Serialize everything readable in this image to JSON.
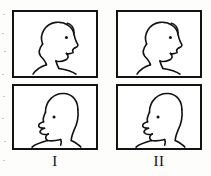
{
  "figure": {
    "ink_color": "#131313",
    "paper_color": "#ffffff",
    "columns": [
      {
        "label": "I",
        "label_name": "roman-numeral-one",
        "panels": [
          {
            "row": "top",
            "caption": "",
            "pose": "relaxed head profile facing right, closed mouth",
            "eye": "dot"
          },
          {
            "row": "bottom",
            "caption": "",
            "pose": "elongated head profile facing right, jaw thrust forward, open mouth",
            "eye": "dot"
          }
        ]
      },
      {
        "label": "II",
        "label_name": "roman-numeral-two",
        "panels": [
          {
            "row": "top",
            "caption": "",
            "pose": "relaxed head profile facing right, closed mouth",
            "eye": "dot"
          },
          {
            "row": "bottom",
            "caption": "",
            "pose": "elongated head profile facing right, jaw thrust forward, open mouth",
            "eye": "dot"
          }
        ]
      }
    ]
  }
}
